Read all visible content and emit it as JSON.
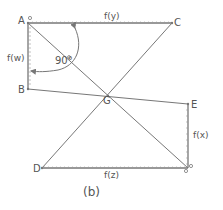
{
  "diagram": {
    "caption": "(b)",
    "points": {
      "A": {
        "label": "A",
        "x": 28,
        "y": 23
      },
      "B": {
        "label": "B",
        "x": 28,
        "y": 89
      },
      "C": {
        "label": "C",
        "x": 172,
        "y": 23
      },
      "D": {
        "label": "D",
        "x": 42,
        "y": 168
      },
      "E": {
        "label": "E",
        "x": 188,
        "y": 104
      },
      "F": {
        "label": "",
        "x": 188,
        "y": 168
      },
      "G": {
        "label": "G",
        "x": 108,
        "y": 96
      }
    },
    "edge_labels": {
      "top": "f(y)",
      "left": "f(w)",
      "right": "f(x)",
      "bottom": "f(z)"
    },
    "angle_label": "90°",
    "origin_marks": {
      "A": "o",
      "F_top": "o",
      "F_bottom": "o"
    },
    "colors": {
      "line": "#777777",
      "text": "#555555",
      "background": "#ffffff"
    }
  }
}
